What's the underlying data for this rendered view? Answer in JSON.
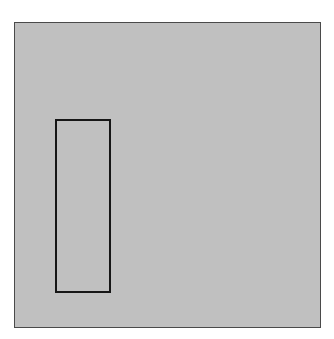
{
  "diagram": {
    "colors": {
      "canvas_fill": "#c0c0c0",
      "canvas_border": "#4a4a4a",
      "rectangle_border": "#161616",
      "page_background": "#ffffff"
    },
    "shapes": [
      {
        "type": "rectangle",
        "role": "outlined-rectangle",
        "fill": "none"
      }
    ]
  }
}
